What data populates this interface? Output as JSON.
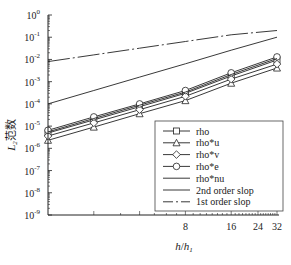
{
  "chart_data": {
    "type": "line",
    "title": "",
    "xlabel": "h/h1",
    "ylabel": "L2范数",
    "xscale": "log2",
    "yscale": "log10",
    "xlim": [
      1,
      32
    ],
    "ylim": [
      1e-09,
      1
    ],
    "x": [
      1,
      2,
      4,
      8,
      16,
      32
    ],
    "x_tick_labels": [
      "8",
      "16",
      "24",
      "32"
    ],
    "x_tick_values": [
      8,
      16,
      24,
      32
    ],
    "y_tick_labels": [
      "10^0",
      "10^-1",
      "10^-2",
      "10^-3",
      "10^-4",
      "10^-5",
      "10^-6",
      "10^-7",
      "10^-8",
      "10^-9"
    ],
    "legend_position": "lower right",
    "series": [
      {
        "name": "rho",
        "marker": "square",
        "style": "solid",
        "values": [
          4.9e-06,
          1.9e-05,
          7.5e-05,
          0.0003,
          0.0018,
          0.0094
        ]
      },
      {
        "name": "rho*u",
        "marker": "triangle",
        "style": "solid",
        "values": [
          2.3e-06,
          9e-06,
          3.6e-05,
          0.00014,
          0.00085,
          0.0041
        ]
      },
      {
        "name": "rho*v",
        "marker": "diamond",
        "style": "solid",
        "values": [
          3.6e-06,
          1.4e-05,
          5.5e-05,
          0.00022,
          0.0013,
          0.0062
        ]
      },
      {
        "name": "rho*e",
        "marker": "circle",
        "style": "solid",
        "values": [
          6.5e-06,
          2.6e-05,
          0.0001,
          0.0004,
          0.0025,
          0.013
        ]
      },
      {
        "name": "rho*nu",
        "marker": "none",
        "style": "solid",
        "values": [
          5.5e-06,
          2.2e-05,
          8.7e-05,
          0.00034,
          0.0021,
          0.011
        ]
      },
      {
        "name": "2nd order slop",
        "marker": "none",
        "style": "solid",
        "values": [
          0.0001,
          0.0004,
          0.0016,
          0.0064,
          0.026,
          0.1
        ]
      },
      {
        "name": "1st order slop",
        "marker": "none",
        "style": "dashdot",
        "values": [
          0.008,
          0.016,
          0.032,
          0.064,
          0.128,
          0.2
        ]
      }
    ]
  },
  "axes": {
    "xlabel_main": "h",
    "xlabel_sep": "/",
    "xlabel_den": "h",
    "xlabel_sub": "1",
    "ylabel_main": "L",
    "ylabel_sub": "2",
    "ylabel_cn": "范数"
  },
  "legend": {
    "items": [
      "rho",
      "rho*u",
      "rho*v",
      "rho*e",
      "rho*nu",
      "2nd order slop",
      "1st order slop"
    ]
  }
}
